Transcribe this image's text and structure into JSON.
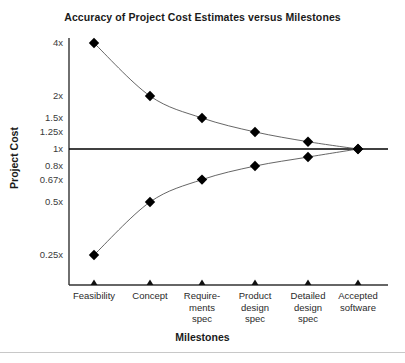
{
  "chart_data": {
    "type": "line",
    "title": "Accuracy of Project Cost Estimates versus Milestones",
    "xlabel": "Milestones",
    "ylabel": "Project Cost",
    "grid": false,
    "legend": "none",
    "yscale": "log",
    "ylim": [
      0.2,
      5
    ],
    "yticks": [
      {
        "value": 4,
        "label": "4x"
      },
      {
        "value": 2,
        "label": "2x"
      },
      {
        "value": 1.5,
        "label": "1.5x"
      },
      {
        "value": 1.25,
        "label": "1.25x"
      },
      {
        "value": 1,
        "label": "1x"
      },
      {
        "value": 0.8,
        "label": "0.8x"
      },
      {
        "value": 0.67,
        "label": "0.67x"
      },
      {
        "value": 0.5,
        "label": "0.5x"
      },
      {
        "value": 0.25,
        "label": "0.25x"
      }
    ],
    "categories": [
      "Feasibility",
      "Concept",
      "Requirements spec",
      "Product design spec",
      "Detailed design spec",
      "Accepted software"
    ],
    "category_lines": [
      [
        "Feasibility"
      ],
      [
        "Concept"
      ],
      [
        "Require-",
        "ments",
        "spec"
      ],
      [
        "Product",
        "design",
        "spec"
      ],
      [
        "Detailed",
        "design",
        "spec"
      ],
      [
        "Accepted",
        "software"
      ]
    ],
    "series": [
      {
        "name": "Upper bound (overestimate)",
        "values": [
          4,
          2,
          1.5,
          1.25,
          1.1,
          1
        ]
      },
      {
        "name": "Lower bound (underestimate)",
        "values": [
          0.25,
          0.5,
          0.67,
          0.8,
          0.9,
          1
        ]
      }
    ],
    "reference_line": {
      "value": 1,
      "label": "1x"
    },
    "colors": {
      "marker": "#000000",
      "curve": "#555555",
      "axis": "#333333",
      "reference": "#000000",
      "text": "#1a1a1a",
      "background": "#ffffff"
    }
  }
}
